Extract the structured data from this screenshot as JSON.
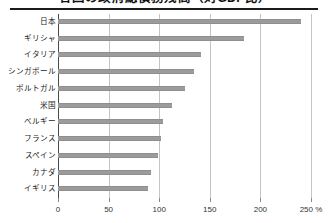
{
  "chart": {
    "title": "各国の政府総債務残高（対GDP比）",
    "x_unit_suffix": "%"
  },
  "chart_data": {
    "type": "bar",
    "orientation": "horizontal",
    "title": "各国の政府総債務残高（対GDP比）",
    "xlabel": "",
    "ylabel": "",
    "xlim": [
      0,
      250
    ],
    "xticks": [
      0,
      50,
      100,
      150,
      200,
      250
    ],
    "xtick_labels": [
      "0",
      "50",
      "100",
      "150",
      "200",
      "250 %"
    ],
    "grid": true,
    "legend": false,
    "categories": [
      "日本",
      "ギリシャ",
      "イタリア",
      "シンガポール",
      "ポルトガル",
      "米国",
      "ベルギー",
      "フランス",
      "スペイン",
      "カナダ",
      "イギリス"
    ],
    "values": [
      240,
      184,
      141,
      134,
      125,
      113,
      104,
      102,
      99,
      92,
      89
    ],
    "bar_color": "#9b9b9b",
    "gridline_color": "#c4c4c4",
    "axis_color": "#4a4a4a"
  }
}
